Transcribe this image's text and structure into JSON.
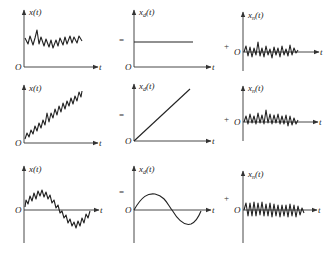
{
  "figure": {
    "rows": [
      {
        "name": "stationary",
        "total": {
          "label_main": "x",
          "label_sub": "",
          "label_tail": "(t)",
          "origin": "O",
          "axis": "t"
        },
        "deterministic": {
          "label_main": "x",
          "label_sub": "d",
          "label_tail": "(t)",
          "origin": "O",
          "axis": "t",
          "shape": "constant"
        },
        "noise": {
          "label_main": "x",
          "label_sub": "n",
          "label_tail": "(t)",
          "origin": "O",
          "axis": "t"
        },
        "equals": "=",
        "plus": "+"
      },
      {
        "name": "linear-trend",
        "total": {
          "label_main": "x",
          "label_sub": "",
          "label_tail": "(t)",
          "origin": "O",
          "axis": "t"
        },
        "deterministic": {
          "label_main": "x",
          "label_sub": "d",
          "label_tail": "(t)",
          "origin": "O",
          "axis": "t",
          "shape": "linear"
        },
        "noise": {
          "label_main": "x",
          "label_sub": "n",
          "label_tail": "(t)",
          "origin": "O",
          "axis": "t"
        },
        "equals": "=",
        "plus": "+"
      },
      {
        "name": "periodic-trend",
        "total": {
          "label_main": "x",
          "label_sub": "",
          "label_tail": "(t)",
          "origin": "O",
          "axis": "t"
        },
        "deterministic": {
          "label_main": "x",
          "label_sub": "d",
          "label_tail": "(t)",
          "origin": "O",
          "axis": "t",
          "shape": "sinusoid"
        },
        "noise": {
          "label_main": "x",
          "label_sub": "n",
          "label_tail": "(t)",
          "origin": "O",
          "axis": "t"
        },
        "equals": "=",
        "plus": "+"
      }
    ]
  }
}
